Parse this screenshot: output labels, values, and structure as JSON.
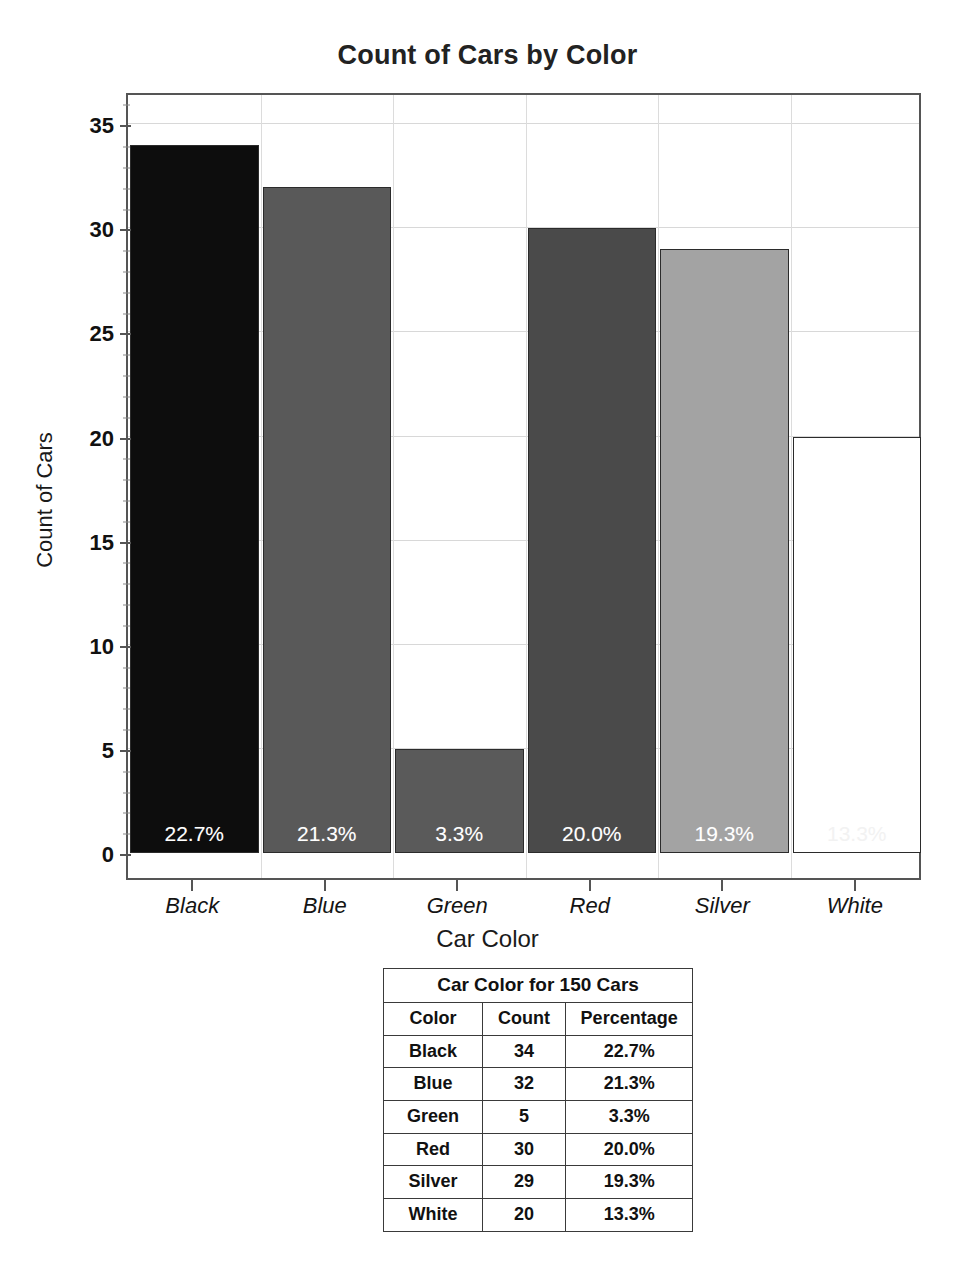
{
  "chart": {
    "title": "Count of Cars by Color",
    "x_axis_title": "Car Color",
    "y_axis_title": "Count of Cars"
  },
  "table": {
    "caption": "Car Color for 150 Cars",
    "headers": [
      "Color",
      "Count",
      "Percentage"
    ],
    "rows": [
      [
        "Black",
        "34",
        "22.7%"
      ],
      [
        "Blue",
        "32",
        "21.3%"
      ],
      [
        "Green",
        "5",
        "3.3%"
      ],
      [
        "Red",
        "30",
        "20.0%"
      ],
      [
        "Silver",
        "29",
        "19.3%"
      ],
      [
        "White",
        "20",
        "13.3%"
      ]
    ]
  },
  "chart_data": {
    "type": "bar",
    "title": "Count of Cars by Color",
    "xlabel": "Car Color",
    "ylabel": "Count of Cars",
    "categories": [
      "Black",
      "Blue",
      "Green",
      "Red",
      "Silver",
      "White"
    ],
    "values": [
      34,
      32,
      5,
      30,
      29,
      20
    ],
    "data_labels": [
      "22.7%",
      "21.3%",
      "3.3%",
      "20.0%",
      "19.3%",
      "13.3%"
    ],
    "bar_colors": [
      "#0d0d0d",
      "#595959",
      "#5a5a5a",
      "#4a4a4a",
      "#a3a3a3",
      "#ffffff"
    ],
    "bar_border_color": "#2b2b2b",
    "ylim": [
      0,
      36.5
    ],
    "yticks": [
      0,
      5,
      10,
      15,
      20,
      25,
      30,
      35
    ],
    "ytick_labels": [
      "0",
      "5",
      "10",
      "15",
      "20",
      "25",
      "30",
      "35"
    ],
    "minor_ytick_step": 1,
    "grid": "horizontal-and-vertical",
    "grid_color": "#d8d8d8",
    "legend": "none",
    "plot_background": "#ffffff",
    "plot_border_color": "#555555",
    "data_label_color": "#ffffff",
    "total_cars": 150
  }
}
